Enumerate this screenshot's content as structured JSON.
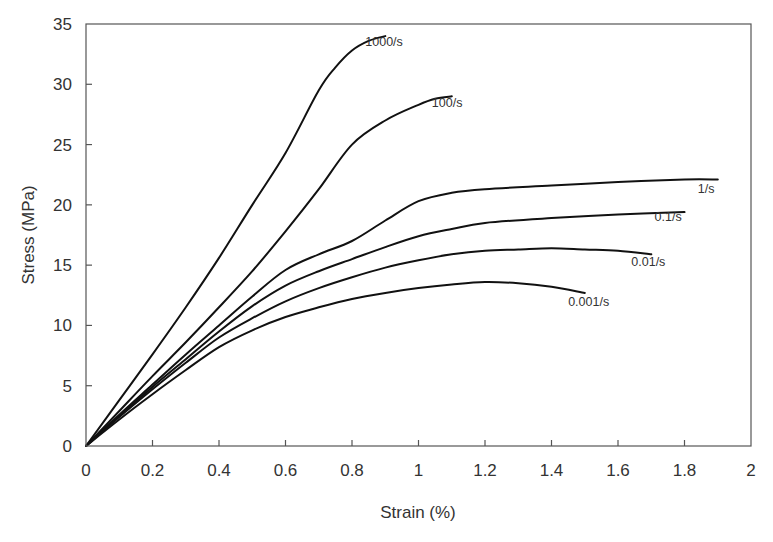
{
  "chart_data": {
    "type": "line",
    "title": "",
    "xlabel": "Strain (%)",
    "ylabel": "Stress (MPa)",
    "xlim": [
      0,
      2
    ],
    "ylim": [
      0,
      35
    ],
    "x_ticks": [
      "0",
      "0.2",
      "0.4",
      "0.6",
      "0.8",
      "1",
      "1.2",
      "1.4",
      "1.6",
      "1.8",
      "2"
    ],
    "y_ticks": [
      "0",
      "5",
      "10",
      "15",
      "20",
      "25",
      "30",
      "35"
    ],
    "grid": false,
    "legend": "inline labels at curve ends",
    "series": [
      {
        "name": "1000/s",
        "label_pos": [
          0.84,
          33.2
        ],
        "x": [
          0,
          0.1,
          0.2,
          0.3,
          0.4,
          0.5,
          0.6,
          0.7,
          0.75,
          0.8,
          0.85,
          0.9
        ],
        "y": [
          0,
          3.8,
          7.6,
          11.5,
          15.6,
          20.0,
          24.3,
          29.5,
          31.4,
          32.8,
          33.6,
          34.0
        ]
      },
      {
        "name": "100/s",
        "label_pos": [
          1.04,
          28.1
        ],
        "x": [
          0,
          0.1,
          0.2,
          0.3,
          0.4,
          0.5,
          0.6,
          0.7,
          0.8,
          0.9,
          1.0,
          1.05,
          1.1
        ],
        "y": [
          0,
          2.9,
          5.8,
          8.6,
          11.5,
          14.5,
          17.8,
          21.3,
          25.0,
          27.0,
          28.3,
          28.8,
          29.0
        ]
      },
      {
        "name": "1/s",
        "label_pos": [
          1.84,
          21.0
        ],
        "x": [
          0,
          0.1,
          0.2,
          0.3,
          0.4,
          0.5,
          0.6,
          0.7,
          0.8,
          0.9,
          1.0,
          1.1,
          1.2,
          1.4,
          1.6,
          1.8,
          1.9
        ],
        "y": [
          0,
          2.6,
          5.1,
          7.6,
          10.0,
          12.4,
          14.6,
          15.9,
          17.0,
          18.7,
          20.3,
          21.0,
          21.3,
          21.6,
          21.9,
          22.1,
          22.1
        ]
      },
      {
        "name": "0.1/s",
        "label_pos": [
          1.71,
          18.7
        ],
        "x": [
          0,
          0.1,
          0.2,
          0.3,
          0.4,
          0.5,
          0.6,
          0.7,
          0.8,
          0.9,
          1.0,
          1.1,
          1.2,
          1.4,
          1.6,
          1.8
        ],
        "y": [
          0,
          2.5,
          4.9,
          7.2,
          9.5,
          11.6,
          13.3,
          14.5,
          15.5,
          16.5,
          17.4,
          18.0,
          18.5,
          18.9,
          19.2,
          19.4
        ]
      },
      {
        "name": "0.01/s",
        "label_pos": [
          1.64,
          14.9
        ],
        "x": [
          0,
          0.1,
          0.2,
          0.3,
          0.4,
          0.5,
          0.6,
          0.7,
          0.8,
          0.9,
          1.0,
          1.1,
          1.2,
          1.3,
          1.4,
          1.5,
          1.6,
          1.7
        ],
        "y": [
          0,
          2.4,
          4.7,
          6.9,
          9.0,
          10.6,
          12.0,
          13.1,
          14.0,
          14.8,
          15.4,
          15.9,
          16.2,
          16.3,
          16.4,
          16.3,
          16.2,
          15.9
        ]
      },
      {
        "name": "0.001/s",
        "label_pos": [
          1.45,
          11.6
        ],
        "x": [
          0,
          0.1,
          0.2,
          0.3,
          0.4,
          0.5,
          0.6,
          0.7,
          0.8,
          0.9,
          1.0,
          1.1,
          1.2,
          1.3,
          1.4,
          1.5
        ],
        "y": [
          0,
          2.2,
          4.3,
          6.3,
          8.2,
          9.6,
          10.7,
          11.5,
          12.2,
          12.7,
          13.1,
          13.4,
          13.6,
          13.5,
          13.2,
          12.7
        ]
      }
    ]
  }
}
